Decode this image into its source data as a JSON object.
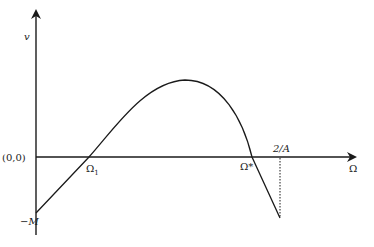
{
  "diagram": {
    "type": "function-curve",
    "axes": {
      "y_label": "v",
      "x_label": "Ω",
      "origin_label": "(0,0)"
    },
    "points": {
      "y_intercept_label": "−M",
      "omega1_label": "Ω",
      "omega1_subscript": "1",
      "omega_star_label": "Ω*",
      "end_label": "2/A"
    },
    "colors": {
      "line": "#1a1a1a",
      "background": "#ffffff"
    }
  }
}
